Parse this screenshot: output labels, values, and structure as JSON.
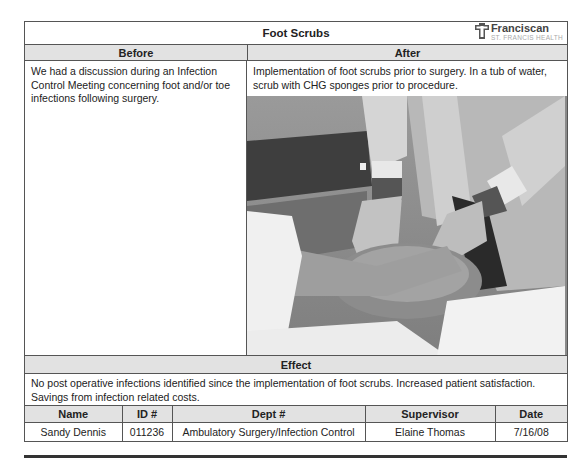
{
  "header": {
    "title": "Foot Scrubs",
    "logo": {
      "name": "Franciscan",
      "subtitle": "ST. FRANCIS HEALTH",
      "icon": "franciscan-cross-icon"
    }
  },
  "columns": {
    "before_label": "Before",
    "after_label": "After"
  },
  "before": {
    "text": "We had a discussion during an Infection Control Meeting concerning foot and/or toe infections following surgery."
  },
  "after": {
    "text": "Implementation of foot scrubs prior to surgery. In a tub of water, scrub with CHG sponges prior to procedure.",
    "photo_description": "Gloved hands scrubbing a patient's foot in a basin of water"
  },
  "effect": {
    "label": "Effect",
    "text": "No post operative infections identified since the implementation of foot scrubs. Increased patient satisfaction. Savings from infection related costs."
  },
  "info_table": {
    "headers": [
      "Name",
      "ID #",
      "Dept #",
      "Supervisor",
      "Date"
    ],
    "rows": [
      [
        "Sandy Dennis",
        "011236",
        "Ambulatory Surgery/Infection Control",
        "Elaine Thomas",
        "7/16/08"
      ]
    ]
  },
  "colors": {
    "header_fill": "#e2e2e2",
    "border": "#555555"
  }
}
